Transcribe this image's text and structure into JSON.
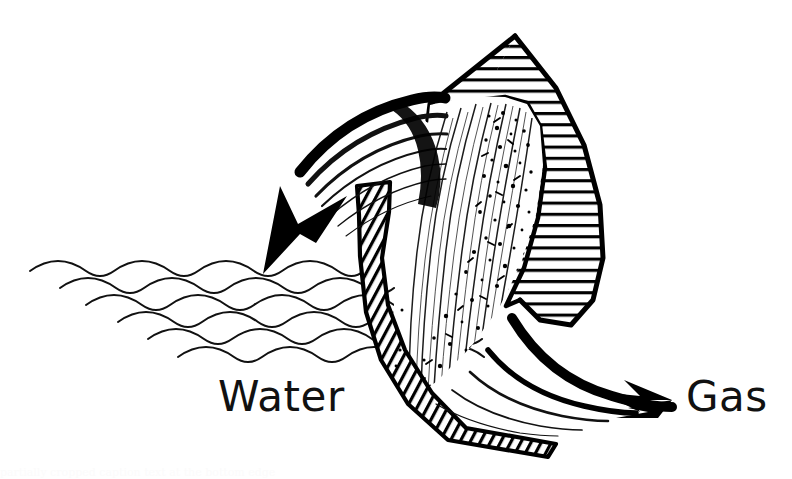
{
  "figure": {
    "background_color": "#ffffff",
    "ink_color": "#000000",
    "labels": {
      "water": "Water",
      "gas": "Gas"
    },
    "annotations": {
      "water_arrow": "curved arrow sweeping left and down into the water surface",
      "gas_arrow": "flat arrow head pointing right toward the gas label",
      "water_surface": "six stacked wavy lines forming the water surface",
      "hatched_blade": "horizontally hatched leaf-shaped blade section at upper right",
      "hatched_band": "narrow diagonally hatched curved band running down the centre",
      "stippled_core": "stippled and streaked flow core between band and blade"
    },
    "caption_clipped": "partially cropped caption text at the bottom edge"
  }
}
